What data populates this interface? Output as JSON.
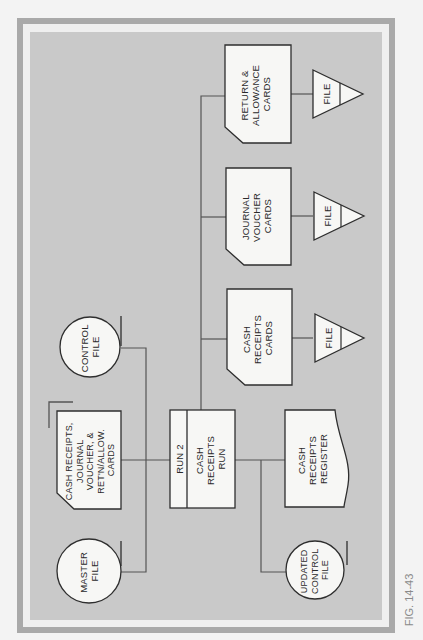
{
  "figure": {
    "caption": "FIG. 14-43",
    "colors": {
      "frame_border": "#a9a9a9",
      "panel": "#c9c9c9",
      "shape_fill": "#f7f7f5",
      "stroke": "#2e2e2e",
      "background": "#f3f3f3"
    }
  },
  "nodes": {
    "return_allowance_cards": {
      "type": "card",
      "lines": [
        "RETURN &",
        "ALLOWANCE",
        "CARDS"
      ]
    },
    "journal_voucher_cards": {
      "type": "card",
      "lines": [
        "JOURNAL",
        "VOUCHER",
        "CARDS"
      ]
    },
    "cash_receipts_cards": {
      "type": "card",
      "lines": [
        "CASH",
        "RECEIPTS",
        "CARDS"
      ]
    },
    "file_1": {
      "type": "offline-storage",
      "label": "FILE"
    },
    "file_2": {
      "type": "offline-storage",
      "label": "FILE"
    },
    "file_3": {
      "type": "offline-storage",
      "label": "FILE"
    },
    "control_file": {
      "type": "magnetic-tape",
      "lines": [
        "CONTROL",
        "FILE"
      ]
    },
    "input_cards": {
      "type": "card-deck",
      "lines": [
        "CASH RECEIPTS,",
        "JOURNAL",
        "VOUCHER, &",
        "RET'N/ALLOW.",
        "CARDS"
      ]
    },
    "run": {
      "type": "process",
      "run_label": "RUN 2",
      "lines": [
        "CASH",
        "RECEIPTS",
        "RUN"
      ]
    },
    "register": {
      "type": "document",
      "lines": [
        "CASH",
        "RECEIPTS",
        "REGISTER"
      ]
    },
    "master_file": {
      "type": "magnetic-tape",
      "lines": [
        "MASTER",
        "FILE"
      ]
    },
    "updated_control_file": {
      "type": "magnetic-tape",
      "lines": [
        "UPDATED",
        "CONTROL",
        "FILE"
      ]
    }
  },
  "edges": [
    [
      "master_file",
      "run"
    ],
    [
      "control_file",
      "run"
    ],
    [
      "input_cards",
      "run"
    ],
    [
      "run",
      "register"
    ],
    [
      "run",
      "updated_control_file"
    ],
    [
      "run",
      "cash_receipts_cards"
    ],
    [
      "run",
      "journal_voucher_cards"
    ],
    [
      "run",
      "return_allowance_cards"
    ],
    [
      "cash_receipts_cards",
      "file_3"
    ],
    [
      "journal_voucher_cards",
      "file_2"
    ],
    [
      "return_allowance_cards",
      "file_1"
    ]
  ]
}
